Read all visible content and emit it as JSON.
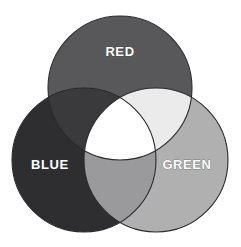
{
  "figure": {
    "background_color": "#ffffff",
    "width": 241,
    "height": 247,
    "outline_color": "#2b2b2d",
    "outline_width": 1.1,
    "label_text_color": "#ffffff"
  },
  "sets": [
    {
      "id": "red",
      "label": "RED",
      "color": "#58585a",
      "center_x": 120,
      "center_y": 88,
      "radius": 72,
      "label_x": 120,
      "label_y": 53
    },
    {
      "id": "blue",
      "label": "BLUE",
      "color": "#2e2e30",
      "center_x": 84,
      "center_y": 160,
      "radius": 72,
      "label_x": 50,
      "label_y": 166
    },
    {
      "id": "green",
      "label": "GREEN",
      "color": "#b0b0b0",
      "center_x": 156,
      "center_y": 160,
      "radius": 72,
      "label_x": 187,
      "label_y": 166
    }
  ],
  "intersections": [
    {
      "id": "red-blue",
      "name": "magenta-region",
      "color": "#3a3a3c"
    },
    {
      "id": "red-green",
      "name": "yellow-region",
      "color": "#ebebeb"
    },
    {
      "id": "blue-green",
      "name": "cyan-region",
      "color": "#9a9a9c"
    },
    {
      "id": "red-blue-green",
      "name": "white-region",
      "color": "#ffffff"
    }
  ]
}
